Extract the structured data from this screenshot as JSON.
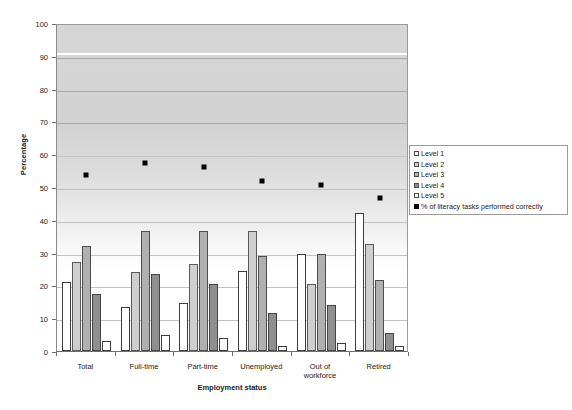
{
  "chart_data": {
    "type": "bar",
    "title": "",
    "xlabel": "Employment status",
    "ylabel": "Percentage",
    "ylim": [
      0,
      100
    ],
    "ytick_step": 10,
    "yticks": [
      0,
      10,
      20,
      30,
      40,
      50,
      60,
      70,
      80,
      90,
      100
    ],
    "grid": true,
    "legend_position": "right",
    "categories": [
      "Total",
      "Full-time",
      "Part-time",
      "Unemployed",
      "Out of workforce",
      "Retired"
    ],
    "category_lines": [
      [
        "Total"
      ],
      [
        "Full-time"
      ],
      [
        "Part-time"
      ],
      [
        "Unemployed"
      ],
      [
        "Out of",
        "workforce"
      ],
      [
        "Retired"
      ]
    ],
    "series": [
      {
        "name": "Level 1",
        "type": "bar",
        "color": "#ffffff",
        "values": [
          21,
          13.5,
          14.5,
          24.5,
          29.5,
          42
        ]
      },
      {
        "name": "Level 2",
        "type": "bar",
        "color": "#cfcfcf",
        "values": [
          27,
          24,
          26.5,
          36.5,
          20.5,
          32.5
        ]
      },
      {
        "name": "Level 3",
        "type": "bar",
        "color": "#b0b0b0",
        "values": [
          32,
          36.5,
          36.5,
          29,
          29.5,
          21.5
        ]
      },
      {
        "name": "Level 4",
        "type": "bar",
        "color": "#8f8f8f",
        "values": [
          17.5,
          23.5,
          20.5,
          11.5,
          14,
          5.5
        ]
      },
      {
        "name": "Level 5",
        "type": "bar",
        "color": "#ffffff",
        "values": [
          3,
          5,
          4,
          1.5,
          2.5,
          1.5
        ]
      },
      {
        "name": "% of literacy tasks performed correctly",
        "type": "scatter",
        "color": "#000000",
        "values": [
          54.5,
          58,
          57,
          52.5,
          51.5,
          47.5
        ]
      }
    ]
  },
  "legend": {
    "items": [
      {
        "label": "Level 1"
      },
      {
        "label": "Level 2"
      },
      {
        "label": "Level 3"
      },
      {
        "label": "Level 4"
      },
      {
        "label": "Level 5"
      },
      {
        "label": "% of literacy tasks performed correctly"
      }
    ]
  }
}
